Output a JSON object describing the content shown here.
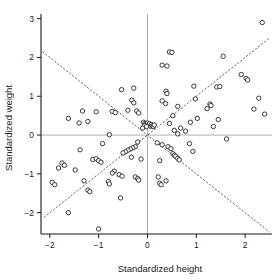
{
  "chart_data": {
    "type": "scatter",
    "title": "",
    "xlabel": "Standardized height",
    "ylabel": "Standardized weight",
    "xlim": [
      -2.18,
      2.55
    ],
    "ylim": [
      -2.55,
      3.12
    ],
    "xticks": [
      -2,
      -1,
      0,
      1,
      2
    ],
    "xticklabels": [
      "−2",
      "−1",
      "0",
      "1",
      "2"
    ],
    "yticks": [
      -2,
      -1,
      0,
      1,
      2,
      3
    ],
    "yticklabels": [
      "−2",
      "−1",
      "0",
      "1",
      "2",
      "3"
    ],
    "grid": false,
    "legend": null,
    "marker": "open-circle",
    "marker_color": "#1a1a1a",
    "marker_fill": "#ffffff",
    "axis_color": "#1a1a1a",
    "crosshair_color": "#9a9a9a",
    "refline_color": "#4a4a4a",
    "reference_lines": [
      {
        "name": "major-axis",
        "slope": 1.0,
        "intercept": 0.0,
        "x_from": -2.12,
        "x_to": 2.5,
        "style": "dashed-fine"
      },
      {
        "name": "minor-axis",
        "slope": -1.0,
        "intercept": 0.0,
        "x_from": -2.15,
        "x_to": 2.5,
        "style": "dashed-fine"
      }
    ],
    "crosshairs": [
      {
        "name": "vertical-zero",
        "x": 0
      },
      {
        "name": "horizontal-zero",
        "y": 0
      }
    ],
    "n_points": 116,
    "points": [
      [
        2.35,
        2.9
      ],
      [
        1.55,
        2.03
      ],
      [
        0.45,
        2.14
      ],
      [
        0.5,
        2.13
      ],
      [
        0.3,
        1.8
      ],
      [
        0.4,
        1.78
      ],
      [
        1.92,
        1.56
      ],
      [
        2.02,
        1.46
      ],
      [
        2.05,
        1.42
      ],
      [
        0.95,
        1.26
      ],
      [
        1.42,
        1.24
      ],
      [
        -0.53,
        1.17
      ],
      [
        -0.28,
        1.21
      ],
      [
        0.38,
        1.13
      ],
      [
        0.4,
        1.07
      ],
      [
        2.28,
        0.95
      ],
      [
        0.98,
        0.93
      ],
      [
        0.3,
        0.88
      ],
      [
        0.37,
        0.81
      ],
      [
        1.28,
        0.8
      ],
      [
        1.3,
        0.76
      ],
      [
        -0.32,
        0.9
      ],
      [
        -0.28,
        0.83
      ],
      [
        0.62,
        0.74
      ],
      [
        1.22,
        0.68
      ],
      [
        2.18,
        0.67
      ],
      [
        -1.62,
        0.43
      ],
      [
        -1.33,
        0.62
      ],
      [
        -1.05,
        0.6
      ],
      [
        -0.72,
        0.61
      ],
      [
        -0.66,
        0.58
      ],
      [
        -0.4,
        0.64
      ],
      [
        -0.22,
        0.62
      ],
      [
        -0.18,
        0.57
      ],
      [
        -1.4,
        0.31
      ],
      [
        -1.22,
        0.35
      ],
      [
        2.4,
        0.54
      ],
      [
        1.45,
        0.4
      ],
      [
        1.02,
        0.43
      ],
      [
        0.52,
        0.5
      ],
      [
        0.88,
        0.33
      ],
      [
        1.35,
        0.22
      ],
      [
        0.45,
        0.3
      ],
      [
        -0.08,
        0.33
      ],
      [
        -0.05,
        0.3
      ],
      [
        -0.03,
        0.28
      ],
      [
        0.0,
        0.31
      ],
      [
        0.02,
        0.26
      ],
      [
        0.04,
        0.29
      ],
      [
        -0.06,
        0.24
      ],
      [
        0.06,
        0.23
      ],
      [
        -0.02,
        0.22
      ],
      [
        0.08,
        0.27
      ],
      [
        0.1,
        0.24
      ],
      [
        0.12,
        0.22
      ],
      [
        0.14,
        0.26
      ],
      [
        -0.78,
        0.01
      ],
      [
        0.55,
        0.12
      ],
      [
        0.78,
        0.1
      ],
      [
        0.62,
        0.03
      ],
      [
        1.62,
        -0.1
      ],
      [
        -0.92,
        -0.22
      ],
      [
        -0.2,
        -0.18
      ],
      [
        0.2,
        -0.2
      ],
      [
        0.3,
        -0.25
      ],
      [
        -1.38,
        -0.38
      ],
      [
        0.42,
        -0.3
      ],
      [
        0.48,
        -0.35
      ],
      [
        0.86,
        -0.22
      ],
      [
        0.93,
        -0.42
      ],
      [
        -0.25,
        -0.3
      ],
      [
        -0.3,
        -0.33
      ],
      [
        -0.35,
        -0.36
      ],
      [
        -0.4,
        -0.39
      ],
      [
        -0.45,
        -0.43
      ],
      [
        -0.5,
        -0.46
      ],
      [
        0.52,
        -0.48
      ],
      [
        0.55,
        -0.52
      ],
      [
        0.58,
        -0.55
      ],
      [
        0.62,
        -0.6
      ],
      [
        0.65,
        -0.64
      ],
      [
        -1.75,
        -0.72
      ],
      [
        -1.7,
        -0.78
      ],
      [
        -1.82,
        -0.85
      ],
      [
        -1.12,
        -0.63
      ],
      [
        -1.05,
        -0.61
      ],
      [
        -1.0,
        -0.66
      ],
      [
        -0.95,
        -0.7
      ],
      [
        -0.33,
        -0.57
      ],
      [
        -0.13,
        -0.62
      ],
      [
        0.25,
        -0.66
      ],
      [
        -1.48,
        -0.9
      ],
      [
        -0.68,
        -0.93
      ],
      [
        -0.72,
        -0.98
      ],
      [
        -0.58,
        -1.02
      ],
      [
        -0.52,
        -1.06
      ],
      [
        -1.95,
        -1.22
      ],
      [
        -1.9,
        -1.28
      ],
      [
        -1.3,
        -1.18
      ],
      [
        -0.8,
        -1.2
      ],
      [
        -0.78,
        -1.26
      ],
      [
        -0.25,
        -1.08
      ],
      [
        -0.2,
        -1.12
      ],
      [
        -0.18,
        -1.16
      ],
      [
        0.22,
        -1.08
      ],
      [
        0.25,
        -1.24
      ],
      [
        0.28,
        -1.28
      ],
      [
        0.38,
        -1.18
      ],
      [
        -1.22,
        -1.42
      ],
      [
        -1.18,
        -1.46
      ],
      [
        -0.55,
        -1.62
      ],
      [
        -1.62,
        -2.0
      ],
      [
        -1.0,
        -2.42
      ],
      [
        0.68,
        0.18
      ],
      [
        -0.1,
        0.18
      ],
      [
        1.48,
        1.25
      ]
    ]
  },
  "figure": {
    "frame_visible_sides": [
      "left",
      "bottom"
    ],
    "background": "#ffffff"
  }
}
